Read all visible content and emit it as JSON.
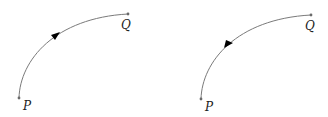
{
  "colors": {
    "curve": "#7a7a7a",
    "point": "#6a6a6a",
    "arrow": "#000000",
    "label": "#222222",
    "background": "#ffffff"
  },
  "diagrams": [
    {
      "id": "left",
      "direction": "P to Q",
      "start": {
        "label": "P",
        "x": 19,
        "y": 98
      },
      "end": {
        "label": "Q",
        "x": 128,
        "y": 14
      },
      "arrow": {
        "x": 55,
        "y": 36,
        "pointing": "toward Q"
      }
    },
    {
      "id": "right",
      "direction": "Q to P",
      "start": {
        "label": "Q",
        "x": 311,
        "y": 15
      },
      "end": {
        "label": "P",
        "x": 201,
        "y": 99
      },
      "arrow": {
        "x": 228,
        "y": 44,
        "pointing": "toward P"
      }
    }
  ],
  "labels": {
    "left_p": "P",
    "left_q": "Q",
    "right_p": "P",
    "right_q": "Q"
  }
}
